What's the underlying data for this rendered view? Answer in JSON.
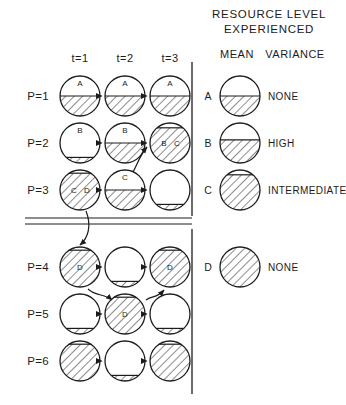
{
  "figure": {
    "title_line1": "RESOURCE  LEVEL",
    "title_line2": "EXPERIENCED",
    "legend_col_mean": "MEAN",
    "legend_col_variance": "VARIANCE"
  },
  "grid": {
    "column_headers": [
      "t=1",
      "t=2",
      "t=3"
    ],
    "row_headers": [
      "P=1",
      "P=2",
      "P=3",
      "P=4",
      "P=5",
      "P=6"
    ],
    "cells": [
      [
        {
          "row": "P=1",
          "col": "t=1",
          "fill_level": 0.5,
          "labels": "A",
          "label_pos": "top"
        },
        {
          "row": "P=1",
          "col": "t=2",
          "fill_level": 0.5,
          "labels": "A",
          "label_pos": "top"
        },
        {
          "row": "P=1",
          "col": "t=3",
          "fill_level": 0.5,
          "labels": "A",
          "label_pos": "top"
        }
      ],
      [
        {
          "row": "P=2",
          "col": "t=1",
          "fill_level": 0.14,
          "labels": "B",
          "label_pos": "top"
        },
        {
          "row": "P=2",
          "col": "t=2",
          "fill_level": 0.5,
          "labels": "B",
          "label_pos": "top"
        },
        {
          "row": "P=2",
          "col": "t=3",
          "fill_level": 0.88,
          "labels": "B C",
          "label_pos": "mid"
        }
      ],
      [
        {
          "row": "P=3",
          "col": "t=1",
          "fill_level": 0.92,
          "labels": "C D",
          "label_pos": "mid"
        },
        {
          "row": "P=3",
          "col": "t=2",
          "fill_level": 0.5,
          "labels": "C",
          "label_pos": "top"
        },
        {
          "row": "P=3",
          "col": "t=3",
          "fill_level": 0.14,
          "labels": "",
          "label_pos": "none"
        }
      ],
      [
        {
          "row": "P=4",
          "col": "t=1",
          "fill_level": 0.92,
          "labels": "D",
          "label_pos": "mid"
        },
        {
          "row": "P=4",
          "col": "t=2",
          "fill_level": 0.14,
          "labels": "",
          "label_pos": "none"
        },
        {
          "row": "P=4",
          "col": "t=3",
          "fill_level": 0.92,
          "labels": "D",
          "label_pos": "mid"
        }
      ],
      [
        {
          "row": "P=5",
          "col": "t=1",
          "fill_level": 0.14,
          "labels": "",
          "label_pos": "none"
        },
        {
          "row": "P=5",
          "col": "t=2",
          "fill_level": 0.92,
          "labels": "D",
          "label_pos": "mid"
        },
        {
          "row": "P=5",
          "col": "t=3",
          "fill_level": 0.14,
          "labels": "",
          "label_pos": "none"
        }
      ],
      [
        {
          "row": "P=6",
          "col": "t=1",
          "fill_level": 0.92,
          "labels": "",
          "label_pos": "none"
        },
        {
          "row": "P=6",
          "col": "t=2",
          "fill_level": 0.14,
          "labels": "",
          "label_pos": "none"
        },
        {
          "row": "P=6",
          "col": "t=3",
          "fill_level": 0.92,
          "labels": "",
          "label_pos": "none"
        }
      ]
    ]
  },
  "legend": {
    "rows": [
      {
        "key": "A",
        "fill_level": 0.5,
        "variance": "NONE"
      },
      {
        "key": "B",
        "fill_level": 0.58,
        "variance": "HIGH"
      },
      {
        "key": "C",
        "fill_level": 0.88,
        "variance": "INTERMEDIATE"
      },
      {
        "key": "D",
        "fill_level": 1.0,
        "variance": "NONE"
      }
    ]
  },
  "style": {
    "ink": "#1c1c1c",
    "paper": "#ffffff"
  }
}
